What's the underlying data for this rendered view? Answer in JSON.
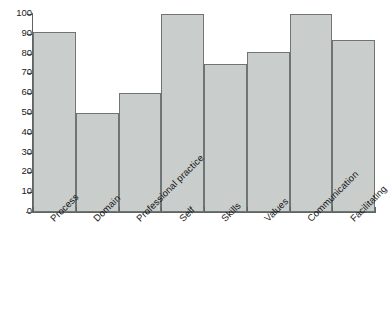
{
  "chart_data": {
    "type": "bar",
    "title": "",
    "subtitle": "",
    "xlabel": "",
    "ylabel": "",
    "ylim": [
      0,
      100
    ],
    "yticks": [
      0,
      10,
      20,
      30,
      40,
      50,
      60,
      70,
      80,
      90,
      100
    ],
    "grid": false,
    "legend": false,
    "legend_position": "none",
    "categories": [
      "Process",
      "Domain",
      "Professional practice",
      "Self",
      "Skills",
      "Values",
      "Communication",
      "Facilitating"
    ],
    "values": [
      91,
      50,
      60,
      100,
      75,
      81,
      100,
      87
    ],
    "bar_fill_color": "#c9cecd",
    "bar_edge_color": "#6e7573",
    "axis_color": "#5d6462",
    "background_color": "#ffffff",
    "xtick_label_rotation": -45,
    "bars_contiguous": true
  }
}
